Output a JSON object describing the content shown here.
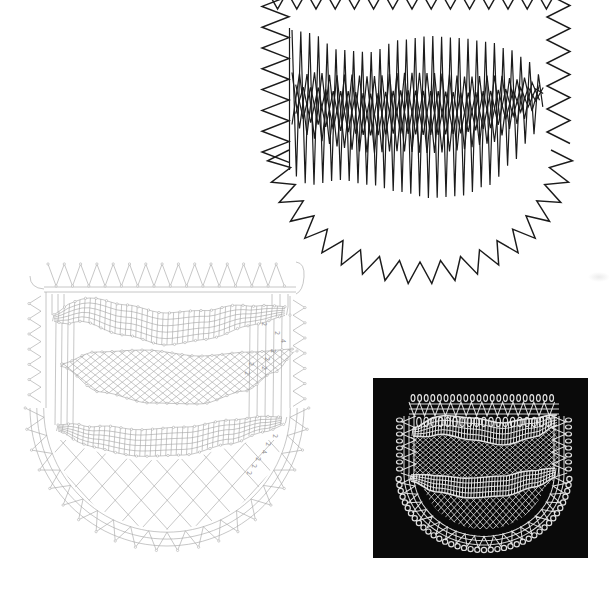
{
  "page": {
    "background": "#ffffff"
  },
  "working_diagram": {
    "stroke": "#1b1b1b"
  },
  "pricking_diagram": {
    "stroke": "#a8a8a8",
    "pin_fill": "#ffffff",
    "label_color": "#8f8f8f",
    "pair_annotations": [
      {
        "value": "2",
        "x": 262,
        "y": 322
      },
      {
        "value": "2",
        "x": 275,
        "y": 331
      },
      {
        "value": "4",
        "x": 281,
        "y": 339
      },
      {
        "value": "2",
        "x": 271,
        "y": 349
      },
      {
        "value": "2",
        "x": 265,
        "y": 357
      },
      {
        "value": "2",
        "x": 262,
        "y": 366
      },
      {
        "value": "2",
        "x": 249,
        "y": 362
      },
      {
        "value": "2",
        "x": 245,
        "y": 371
      },
      {
        "value": "2",
        "x": 273,
        "y": 434
      },
      {
        "value": "2",
        "x": 266,
        "y": 442
      },
      {
        "value": "4",
        "x": 262,
        "y": 450
      },
      {
        "value": "2",
        "x": 256,
        "y": 457
      },
      {
        "value": "2",
        "x": 252,
        "y": 464
      },
      {
        "value": "2",
        "x": 247,
        "y": 471
      }
    ]
  },
  "lace_photo": {
    "background": "#0a0a0a",
    "thread": "#ececec"
  }
}
